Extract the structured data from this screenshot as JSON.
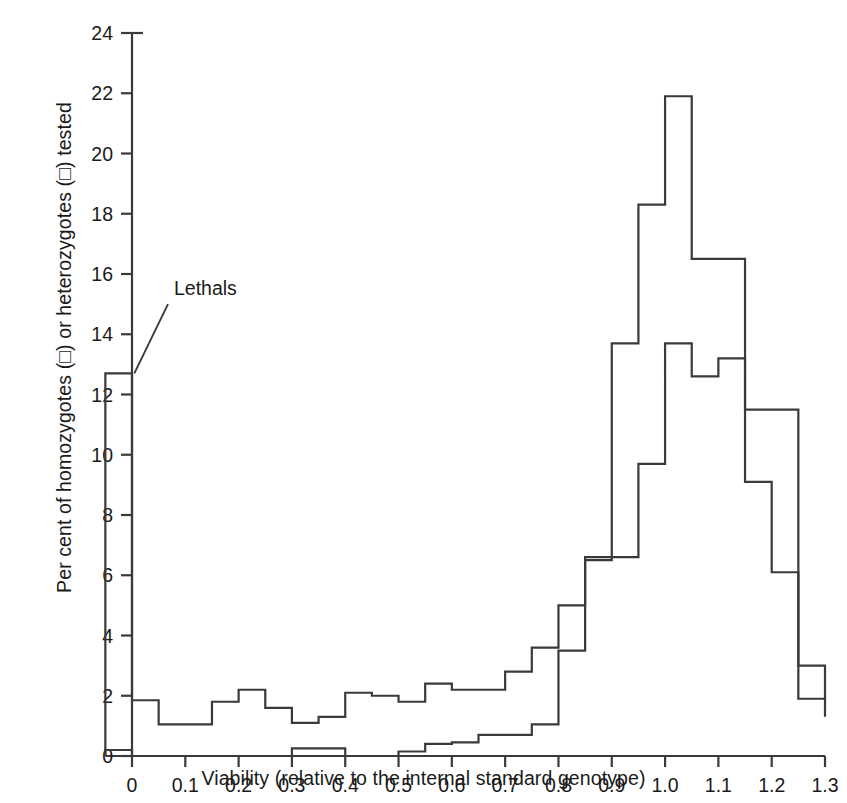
{
  "chart_data": {
    "type": "line",
    "title": "",
    "subtitle": "",
    "xlabel": "Viability (relative to the internal standard genotype)",
    "ylabel": "Per cent of homozygotes (□) or heterozygotes (□) tested",
    "xlim": [
      -0.05,
      1.3
    ],
    "ylim": [
      0,
      24
    ],
    "xticks": [
      "0",
      "0.1",
      "0.2",
      "0.3",
      "0.4",
      "0.5",
      "0.6",
      "0.7",
      "0.8",
      "0.9",
      "1.0",
      "1.1",
      "1.2",
      "1.3"
    ],
    "xtick_values": [
      0,
      0.1,
      0.2,
      0.3,
      0.4,
      0.5,
      0.6,
      0.7,
      0.8,
      0.9,
      1.0,
      1.1,
      1.2,
      1.3
    ],
    "yticks": [
      "0",
      "2",
      "4",
      "6",
      "8",
      "10",
      "12",
      "14",
      "16",
      "18",
      "20",
      "22",
      "24"
    ],
    "ytick_values": [
      0,
      2,
      4,
      6,
      8,
      10,
      12,
      14,
      16,
      18,
      20,
      22,
      24
    ],
    "grid": false,
    "legend_position": "none",
    "bin_width": 0.05,
    "bin_edges": [
      -0.05,
      0.0,
      0.05,
      0.1,
      0.15,
      0.2,
      0.25,
      0.3,
      0.35,
      0.4,
      0.45,
      0.5,
      0.55,
      0.6,
      0.65,
      0.7,
      0.75,
      0.8,
      0.85,
      0.9,
      0.95,
      1.0,
      1.05,
      1.1,
      1.15,
      1.2,
      1.25,
      1.3
    ],
    "series": [
      {
        "name": "homozygotes",
        "symbol": "□",
        "values": [
          12.7,
          1.85,
          1.05,
          1.05,
          1.8,
          2.2,
          1.6,
          1.1,
          1.3,
          2.1,
          2.0,
          1.8,
          2.4,
          2.2,
          2.2,
          2.8,
          3.6,
          5.0,
          6.5,
          6.6,
          9.7,
          13.7,
          12.6,
          13.2,
          9.1,
          6.1,
          1.9,
          1.3
        ]
      },
      {
        "name": "heterozygotes",
        "symbol": "□",
        "values": [
          0.2,
          0.0,
          0.0,
          0.0,
          0.0,
          0.0,
          0.0,
          0.25,
          0.25,
          0.0,
          0.0,
          0.15,
          0.4,
          0.45,
          0.7,
          0.7,
          1.05,
          3.5,
          6.6,
          13.7,
          18.3,
          21.9,
          16.5,
          16.5,
          11.5,
          11.5,
          3.0,
          1.85
        ]
      }
    ],
    "annotations": [
      {
        "text": "Lethals",
        "x": 0.06,
        "y": 15.3,
        "pointer_x": -0.005,
        "pointer_y": 12.7
      }
    ]
  }
}
